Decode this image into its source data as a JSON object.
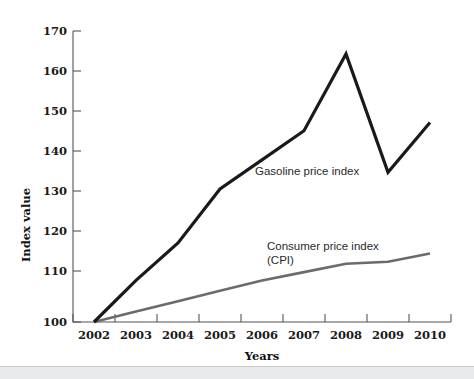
{
  "chart_data": {
    "type": "line",
    "title": "",
    "xlabel": "Years",
    "ylabel": "Index value",
    "categories": [
      "2002",
      "2003",
      "2004",
      "2005",
      "2006",
      "2007",
      "2008",
      "2009",
      "2010"
    ],
    "ylim": [
      100,
      170
    ],
    "ytick_labels": [
      "100",
      "110",
      "120",
      "130",
      "140",
      "150",
      "160",
      "170"
    ],
    "yticks": [
      100,
      110,
      120,
      130,
      140,
      150,
      160,
      170
    ],
    "grid": false,
    "legend_position": "inline-annotation",
    "series": [
      {
        "name": "Gasoline price index",
        "color": "#1a1a1a",
        "line_width": 3.2,
        "values": [
          100,
          110,
          119,
          132,
          139,
          146,
          164.5,
          136,
          148
        ]
      },
      {
        "name": "Consumer price index (CPI)",
        "color": "#6b6b6b",
        "line_width": 2.6,
        "values": [
          100,
          102.5,
          105,
          107.5,
          110,
          112,
          114,
          114.5,
          116.5
        ]
      }
    ],
    "annotations": [
      {
        "text": "Gasoline price index",
        "x_value": 2006.2,
        "y_value": 142.5
      },
      {
        "text": "Consumer price index",
        "x_value": 2006.6,
        "y_value": 121.2
      },
      {
        "text": "(CPI)",
        "x_value": 2006.6,
        "y_value": 118.4
      }
    ]
  },
  "axes": {
    "y_axis_label": "Index value",
    "x_axis_label": "Years",
    "y_tick_100": "100",
    "y_tick_110": "110",
    "y_tick_120": "120",
    "y_tick_130": "130",
    "y_tick_140": "140",
    "y_tick_150": "150",
    "y_tick_160": "160",
    "y_tick_170": "170",
    "x_tick_2002": "2002",
    "x_tick_2003": "2003",
    "x_tick_2004": "2004",
    "x_tick_2005": "2005",
    "x_tick_2006": "2006",
    "x_tick_2007": "2007",
    "x_tick_2008": "2008",
    "x_tick_2009": "2009",
    "x_tick_2010": "2010"
  },
  "labels": {
    "gasoline_series": "Gasoline price index",
    "cpi_series_line1": "Consumer price index",
    "cpi_series_line2": "(CPI)"
  },
  "colors": {
    "gasoline_line": "#1a1a1a",
    "cpi_line": "#6b6b6b",
    "axis": "#555555",
    "background": "#ffffff"
  }
}
